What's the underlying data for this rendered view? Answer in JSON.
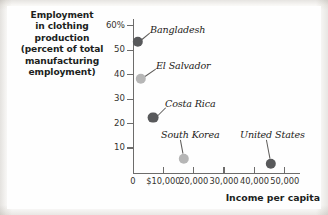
{
  "chart_data": {
    "type": "scatter",
    "title_lines": [
      "Employment",
      "in clothing",
      "production",
      "(percent of total",
      "manufacturing",
      "employment)"
    ],
    "title": "Employment in clothing production (percent of total manufacturing employment)",
    "xlabel": "Income per capita",
    "ylabel": "Employment in clothing production (percent of total manufacturing employment)",
    "xlim": [
      0,
      55000
    ],
    "ylim": [
      0,
      63
    ],
    "grid": false,
    "legend": "none",
    "y_ticks": [
      {
        "label": "60%",
        "value": 60
      },
      {
        "label": "50",
        "value": 50
      },
      {
        "label": "40",
        "value": 40
      },
      {
        "label": "30",
        "value": 30
      },
      {
        "label": "20",
        "value": 20
      },
      {
        "label": "10",
        "value": 10
      }
    ],
    "x_ticks": [
      {
        "label": "0",
        "value": 0
      },
      {
        "label": "$10,000",
        "value": 10000
      },
      {
        "label": "20,000",
        "value": 20000
      },
      {
        "label": "30,000",
        "value": 30000
      },
      {
        "label": "40,000",
        "value": 40000
      },
      {
        "label": "50,000",
        "value": 50000
      }
    ],
    "points": [
      {
        "name": "Bangladesh",
        "x": 1500,
        "y": 52.5,
        "color": "#58595b",
        "radius": 5.2,
        "px": 137.5,
        "py": 42.0,
        "label_x": 150,
        "label_y": 24,
        "leader_x1": 141.5,
        "leader_y1": 39.0,
        "leader_x2": 149.5,
        "leader_y2": 32.5
      },
      {
        "name": "El Salvador",
        "x": 2600,
        "y": 36.5,
        "color": "#b6b6b6",
        "radius": 5.2,
        "px": 140.5,
        "py": 79.0,
        "label_x": 156,
        "label_y": 60,
        "leader_x1": 144.5,
        "leader_y1": 76.0,
        "leader_x2": 155.5,
        "leader_y2": 68.5
      },
      {
        "name": "Costa Rica",
        "x": 6200,
        "y": 20.5,
        "color": "#58595b",
        "radius": 5.4,
        "px": 153.0,
        "py": 117.5,
        "label_x": 165,
        "label_y": 98,
        "leader_x1": 157.5,
        "leader_y1": 114.5,
        "leader_x2": 165.5,
        "leader_y2": 106.5
      },
      {
        "name": "South Korea",
        "x": 15800,
        "y": 4.5,
        "color": "#b6b6b6",
        "radius": 5.2,
        "px": 184.0,
        "py": 158.5,
        "label_x": 161,
        "label_y": 129,
        "leader_x1": 183.0,
        "leader_y1": 153.0,
        "leader_x2": 180.5,
        "leader_y2": 139.5
      },
      {
        "name": "United States",
        "x": 43000,
        "y": 2.5,
        "color": "#58595b",
        "radius": 5.2,
        "px": 271.0,
        "py": 163.5,
        "label_x": 240,
        "label_y": 129,
        "leader_x1": 270.0,
        "leader_y1": 158.0,
        "leader_x2": 266.5,
        "leader_y2": 139.5
      }
    ],
    "colors": {
      "marker_dark": "#58595b",
      "marker_light": "#b6b6b6",
      "axis": "#6d6c6b",
      "text": "#201e1d",
      "plate": "#fefefe"
    }
  }
}
